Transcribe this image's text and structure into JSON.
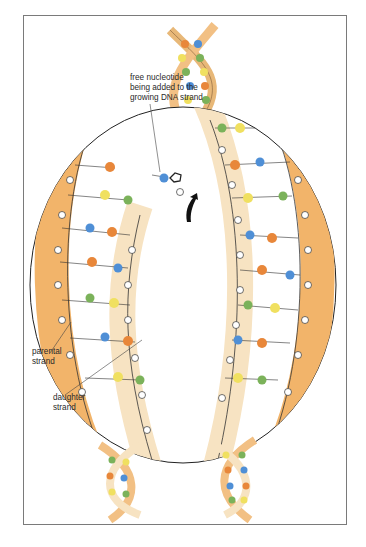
{
  "figure": {
    "labels": {
      "nucleotide": [
        "free nucleotide",
        "being added to the",
        "growing DNA strand"
      ],
      "parental": [
        "parental",
        "strand"
      ],
      "daughter": [
        "daughter",
        "strand"
      ]
    },
    "colors": {
      "parental_strand": "#f2b46a",
      "daughter_strand": "#f7e3c2",
      "base_blue": "#4f8fd6",
      "base_green": "#7bb25a",
      "base_orange": "#e8873a",
      "base_yellow": "#f0e060",
      "outline": "#222222"
    }
  }
}
